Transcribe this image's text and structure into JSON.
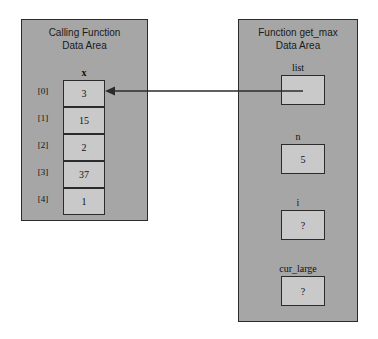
{
  "diagram": {
    "title_left": "Calling Function\nData Area",
    "title_right": "Function get_max\nData Area"
  },
  "calling_function": {
    "array_name": "x",
    "cells": [
      {
        "index": "[0]",
        "value": "3"
      },
      {
        "index": "[1]",
        "value": "15"
      },
      {
        "index": "[2]",
        "value": "2"
      },
      {
        "index": "[3]",
        "value": "37"
      },
      {
        "index": "[4]",
        "value": "1"
      }
    ]
  },
  "get_max_function": {
    "variables": [
      {
        "label": "list",
        "value": ""
      },
      {
        "label": "n",
        "value": "5"
      },
      {
        "label": "i",
        "value": "?"
      },
      {
        "label": "cur_large",
        "value": "?"
      }
    ]
  },
  "colors": {
    "background": "#ffffff",
    "panel_fill": "#a6a6a6",
    "box_fill": "#c9c9c9",
    "stroke": "#2b2b2b",
    "text": "#111111"
  }
}
